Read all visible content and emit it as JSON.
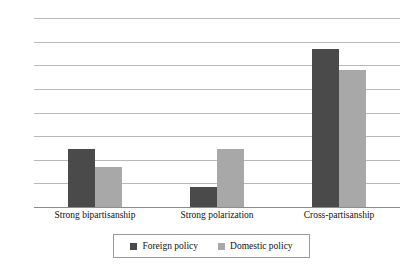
{
  "chart_data": {
    "type": "bar",
    "title": "",
    "subtitle": "",
    "xlabel": "",
    "ylabel": "",
    "categories": [
      "Strong bipartisanship",
      "Strong polarization",
      "Cross-partisanship"
    ],
    "series": [
      {
        "name": "Foreign policy",
        "color": "#4a4a4a",
        "values": [
          24.5,
          8.5,
          67.0
        ]
      },
      {
        "name": "Domestic policy",
        "color": "#a8a8a8",
        "values": [
          17.0,
          24.5,
          58.0
        ]
      }
    ],
    "ylim": [
      0,
      80
    ],
    "ytick_values": [
      0,
      10,
      20,
      30,
      40,
      50,
      60,
      70,
      80
    ],
    "ytick_labels": [
      "0%",
      "10%",
      "20%",
      "30%",
      "40%",
      "50%",
      "60%",
      "70%",
      "80%"
    ],
    "grid": true,
    "legend_position": "bottom",
    "legend_entries": [
      "Foreign policy",
      "Domestic policy"
    ],
    "annotations": []
  }
}
